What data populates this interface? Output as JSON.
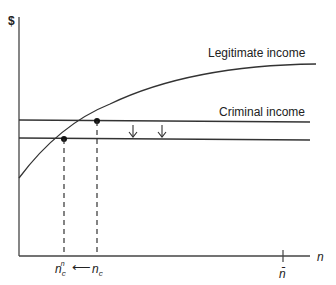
{
  "axes": {
    "y_label": "$",
    "x_label": "n",
    "x_tick_label": "n̄"
  },
  "curves": {
    "legitimate_income_label": "Legitimate income",
    "criminal_income_label": "Criminal income"
  },
  "x_markers": {
    "new_label_base": "n",
    "new_label_sub": "c",
    "new_label_sup": "n",
    "old_label_base": "n",
    "old_label_sub": "c",
    "arrow": "⟵"
  },
  "colors": {
    "line": "#333333",
    "dot": "#111111"
  }
}
